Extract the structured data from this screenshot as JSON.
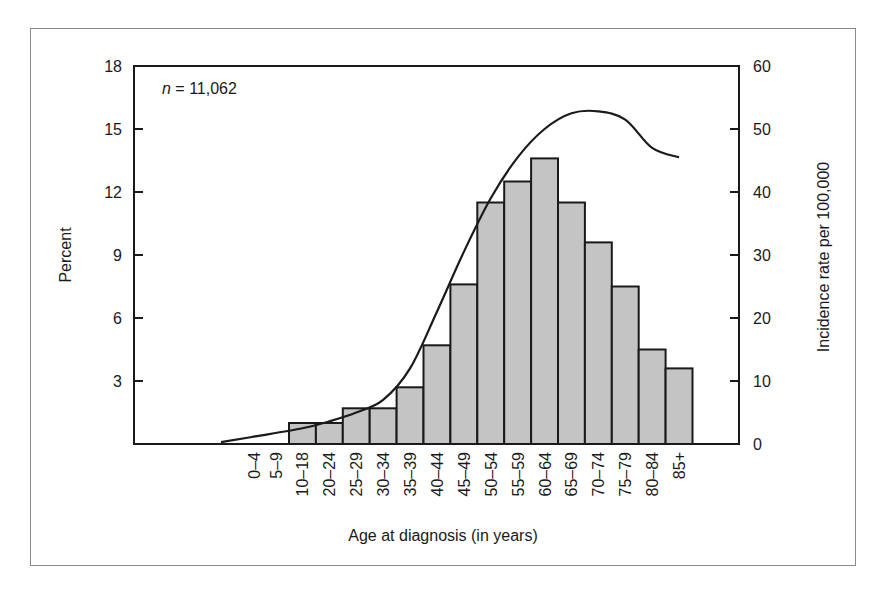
{
  "chart_data": {
    "type": "bar",
    "title": "",
    "annotation": {
      "prefix": "n",
      "text": " = 11,062"
    },
    "xlabel": "Age at diagnosis (in years)",
    "ylabel": "Percent",
    "y2label": "Incidence rate per 100,000",
    "ylim": [
      0,
      18
    ],
    "y2lim": [
      0,
      60
    ],
    "yticks": [
      3,
      6,
      9,
      12,
      15,
      18
    ],
    "y2ticks": [
      0,
      10,
      20,
      30,
      40,
      50,
      60
    ],
    "grid": false,
    "categories": [
      "0–4",
      "5–9",
      "10–18",
      "20–24",
      "25–29",
      "30–34",
      "35–39",
      "40–44",
      "45–49",
      "50–54",
      "55–59",
      "60–64",
      "65–69",
      "70–74",
      "75–79",
      "80–84",
      "85+"
    ],
    "series": [
      {
        "name": "Percent of cases",
        "type": "bar",
        "axis": "left",
        "color": "#c4c4c4",
        "values": [
          0,
          0,
          1.0,
          1.0,
          1.7,
          1.7,
          2.7,
          4.7,
          7.6,
          11.5,
          12.5,
          13.6,
          11.5,
          9.6,
          7.5,
          4.5,
          3.6
        ]
      },
      {
        "name": "Incidence rate per 100,000",
        "type": "line",
        "axis": "right",
        "color": "#1a1a1a",
        "values": [
          0.3,
          1.2,
          2.5,
          3.6,
          5.0,
          7.0,
          12.0,
          21.0,
          30.5,
          39.0,
          45.5,
          50.0,
          52.5,
          52.8,
          51.5,
          47.0,
          45.5
        ]
      }
    ]
  }
}
